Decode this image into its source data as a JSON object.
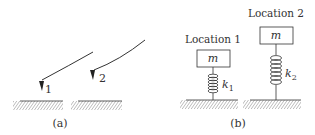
{
  "panel_a": {
    "caption": "(a)",
    "pointers": [
      {
        "label": "1"
      },
      {
        "label": "2"
      }
    ]
  },
  "panel_b": {
    "caption": "(b)",
    "systems": [
      {
        "location_label": "Location 1",
        "mass_label": "m",
        "spring_label": "k",
        "spring_subscript": "1"
      },
      {
        "location_label": "Location 2",
        "mass_label": "m",
        "spring_label": "k",
        "spring_subscript": "2"
      }
    ]
  },
  "colors": {
    "stroke": "#333333",
    "hatch": "#555555",
    "background": "#ffffff"
  }
}
